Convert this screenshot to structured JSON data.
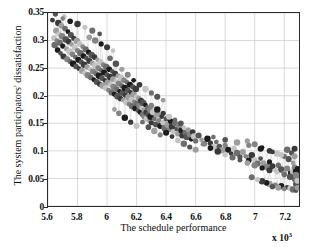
{
  "chart_data": {
    "type": "scatter",
    "title": "",
    "xlabel": "The schedule performance",
    "ylabel": "The system participators' dissatisfaction",
    "x_exponent_label": "x 10",
    "x_exponent_power": "3",
    "xlim": [
      5.6,
      7.3
    ],
    "ylim": [
      0,
      0.35
    ],
    "xticks": [
      "5.6",
      "5.8",
      "6",
      "6.2",
      "6.4",
      "6.6",
      "6.8",
      "7",
      "7.2"
    ],
    "xtick_values": [
      5.6,
      5.8,
      6.0,
      6.2,
      6.4,
      6.6,
      6.8,
      7.0,
      7.2
    ],
    "yticks": [
      "0",
      "0.05",
      "0.1",
      "0.15",
      "0.2",
      "0.25",
      "0.3",
      "0.35"
    ],
    "ytick_values": [
      0,
      0.05,
      0.1,
      0.15,
      0.2,
      0.25,
      0.3,
      0.35
    ],
    "grid": true,
    "grid_color": "#c9c9c9",
    "legend": "none",
    "marker": "circle",
    "marker_colors": [
      "#3a3a3a",
      "#6e6e6e",
      "#9e9e9e",
      "#1c1c1c",
      "#c4c4c4",
      "#545454",
      "#848484"
    ],
    "connector_line_color": "#d8d8d8",
    "series": [
      {
        "name": "pareto-front",
        "points": [
          [
            5.63,
            0.337
          ],
          [
            5.64,
            0.305
          ],
          [
            5.645,
            0.292
          ],
          [
            5.65,
            0.348
          ],
          [
            5.655,
            0.318
          ],
          [
            5.66,
            0.3
          ],
          [
            5.665,
            0.283
          ],
          [
            5.67,
            0.332
          ],
          [
            5.675,
            0.312
          ],
          [
            5.68,
            0.296
          ],
          [
            5.685,
            0.277
          ],
          [
            5.69,
            0.327
          ],
          [
            5.695,
            0.308
          ],
          [
            5.7,
            0.29
          ],
          [
            5.705,
            0.271
          ],
          [
            5.71,
            0.344
          ],
          [
            5.715,
            0.322
          ],
          [
            5.72,
            0.302
          ],
          [
            5.725,
            0.285
          ],
          [
            5.73,
            0.266
          ],
          [
            5.735,
            0.316
          ],
          [
            5.74,
            0.298
          ],
          [
            5.745,
            0.28
          ],
          [
            5.75,
            0.262
          ],
          [
            5.755,
            0.31
          ],
          [
            5.76,
            0.293
          ],
          [
            5.765,
            0.275
          ],
          [
            5.77,
            0.258
          ],
          [
            5.775,
            0.304
          ],
          [
            5.78,
            0.287
          ],
          [
            5.785,
            0.27
          ],
          [
            5.79,
            0.253
          ],
          [
            5.795,
            0.299
          ],
          [
            5.8,
            0.282
          ],
          [
            5.805,
            0.265
          ],
          [
            5.81,
            0.249
          ],
          [
            5.815,
            0.294
          ],
          [
            5.82,
            0.277
          ],
          [
            5.825,
            0.261
          ],
          [
            5.83,
            0.245
          ],
          [
            5.835,
            0.289
          ],
          [
            5.84,
            0.272
          ],
          [
            5.845,
            0.256
          ],
          [
            5.85,
            0.241
          ],
          [
            5.855,
            0.284
          ],
          [
            5.86,
            0.268
          ],
          [
            5.865,
            0.252
          ],
          [
            5.87,
            0.237
          ],
          [
            5.875,
            0.279
          ],
          [
            5.88,
            0.263
          ],
          [
            5.885,
            0.248
          ],
          [
            5.89,
            0.233
          ],
          [
            5.895,
            0.274
          ],
          [
            5.9,
            0.259
          ],
          [
            5.905,
            0.244
          ],
          [
            5.91,
            0.229
          ],
          [
            5.915,
            0.27
          ],
          [
            5.92,
            0.255
          ],
          [
            5.925,
            0.24
          ],
          [
            5.93,
            0.225
          ],
          [
            5.935,
            0.265
          ],
          [
            5.94,
            0.25
          ],
          [
            5.945,
            0.236
          ],
          [
            5.95,
            0.221
          ],
          [
            5.955,
            0.261
          ],
          [
            5.96,
            0.246
          ],
          [
            5.965,
            0.232
          ],
          [
            5.97,
            0.218
          ],
          [
            5.975,
            0.256
          ],
          [
            5.98,
            0.242
          ],
          [
            5.985,
            0.228
          ],
          [
            5.99,
            0.214
          ],
          [
            5.995,
            0.252
          ],
          [
            6.0,
            0.238
          ],
          [
            6.005,
            0.224
          ],
          [
            6.01,
            0.21
          ],
          [
            6.015,
            0.248
          ],
          [
            6.02,
            0.234
          ],
          [
            6.025,
            0.22
          ],
          [
            6.03,
            0.206
          ],
          [
            6.035,
            0.244
          ],
          [
            6.04,
            0.23
          ],
          [
            6.045,
            0.216
          ],
          [
            6.05,
            0.203
          ],
          [
            6.055,
            0.24
          ],
          [
            6.06,
            0.226
          ],
          [
            6.065,
            0.212
          ],
          [
            6.07,
            0.199
          ],
          [
            6.075,
            0.236
          ],
          [
            6.08,
            0.222
          ],
          [
            6.085,
            0.208
          ],
          [
            6.09,
            0.195
          ],
          [
            6.095,
            0.232
          ],
          [
            6.1,
            0.218
          ],
          [
            6.105,
            0.205
          ],
          [
            6.11,
            0.192
          ],
          [
            6.115,
            0.228
          ],
          [
            6.12,
            0.214
          ],
          [
            6.125,
            0.201
          ],
          [
            6.13,
            0.188
          ],
          [
            6.135,
            0.224
          ],
          [
            6.14,
            0.21
          ],
          [
            6.145,
            0.197
          ],
          [
            6.15,
            0.185
          ],
          [
            6.155,
            0.22
          ],
          [
            6.16,
            0.206
          ],
          [
            6.165,
            0.193
          ],
          [
            6.17,
            0.181
          ],
          [
            6.175,
            0.216
          ],
          [
            6.18,
            0.202
          ],
          [
            6.185,
            0.189
          ],
          [
            6.19,
            0.177
          ],
          [
            6.195,
            0.212
          ],
          [
            6.2,
            0.198
          ],
          [
            6.205,
            0.186
          ],
          [
            6.21,
            0.173
          ],
          [
            6.215,
            0.195
          ],
          [
            6.22,
            0.182
          ],
          [
            6.225,
            0.17
          ],
          [
            6.23,
            0.191
          ],
          [
            6.235,
            0.178
          ],
          [
            6.24,
            0.166
          ],
          [
            6.245,
            0.187
          ],
          [
            6.25,
            0.174
          ],
          [
            6.255,
            0.162
          ],
          [
            6.26,
            0.183
          ],
          [
            6.265,
            0.17
          ],
          [
            6.27,
            0.158
          ],
          [
            6.275,
            0.178
          ],
          [
            6.28,
            0.166
          ],
          [
            6.285,
            0.155
          ],
          [
            6.29,
            0.174
          ],
          [
            6.295,
            0.162
          ],
          [
            6.3,
            0.151
          ],
          [
            6.31,
            0.17
          ],
          [
            6.32,
            0.158
          ],
          [
            6.33,
            0.148
          ],
          [
            6.34,
            0.166
          ],
          [
            6.35,
            0.155
          ],
          [
            6.36,
            0.145
          ],
          [
            6.37,
            0.162
          ],
          [
            6.38,
            0.151
          ],
          [
            6.39,
            0.141
          ],
          [
            6.4,
            0.158
          ],
          [
            6.41,
            0.147
          ],
          [
            6.42,
            0.138
          ],
          [
            6.43,
            0.154
          ],
          [
            6.44,
            0.144
          ],
          [
            6.45,
            0.135
          ],
          [
            6.46,
            0.15
          ],
          [
            6.47,
            0.14
          ],
          [
            6.48,
            0.131
          ],
          [
            6.49,
            0.146
          ],
          [
            6.5,
            0.137
          ],
          [
            6.51,
            0.128
          ],
          [
            6.52,
            0.142
          ],
          [
            6.53,
            0.133
          ],
          [
            6.54,
            0.125
          ],
          [
            6.55,
            0.138
          ],
          [
            6.56,
            0.13
          ],
          [
            6.57,
            0.121
          ],
          [
            6.58,
            0.134
          ],
          [
            6.59,
            0.126
          ],
          [
            6.6,
            0.118
          ],
          [
            6.62,
            0.128
          ],
          [
            6.64,
            0.12
          ],
          [
            6.66,
            0.113
          ],
          [
            6.68,
            0.122
          ],
          [
            6.7,
            0.114
          ],
          [
            6.72,
            0.107
          ],
          [
            6.74,
            0.116
          ],
          [
            6.76,
            0.108
          ],
          [
            6.78,
            0.101
          ],
          [
            6.8,
            0.11
          ],
          [
            6.82,
            0.102
          ],
          [
            6.84,
            0.095
          ],
          [
            6.86,
            0.104
          ],
          [
            6.88,
            0.096
          ],
          [
            6.9,
            0.089
          ],
          [
            6.92,
            0.098
          ],
          [
            6.94,
            0.09
          ],
          [
            6.96,
            0.083
          ],
          [
            6.98,
            0.092
          ],
          [
            7.0,
            0.084
          ],
          [
            7.02,
            0.077
          ],
          [
            7.04,
            0.086
          ],
          [
            7.06,
            0.078
          ],
          [
            7.08,
            0.071
          ],
          [
            7.1,
            0.08
          ],
          [
            7.12,
            0.072
          ],
          [
            7.14,
            0.065
          ],
          [
            7.16,
            0.074
          ],
          [
            7.18,
            0.066
          ],
          [
            7.2,
            0.059
          ],
          [
            7.22,
            0.068
          ],
          [
            7.24,
            0.06
          ],
          [
            7.25,
            0.053
          ],
          [
            7.26,
            0.062
          ],
          [
            7.27,
            0.048
          ],
          [
            7.28,
            0.04
          ],
          [
            6.05,
            0.175
          ],
          [
            6.08,
            0.168
          ],
          [
            6.12,
            0.16
          ],
          [
            6.16,
            0.152
          ],
          [
            6.2,
            0.145
          ],
          [
            6.24,
            0.152
          ],
          [
            6.28,
            0.143
          ],
          [
            6.32,
            0.136
          ],
          [
            6.36,
            0.129
          ],
          [
            6.4,
            0.133
          ],
          [
            6.44,
            0.126
          ],
          [
            6.48,
            0.119
          ],
          [
            6.52,
            0.113
          ],
          [
            6.56,
            0.107
          ],
          [
            6.6,
            0.102
          ],
          [
            6.65,
            0.112
          ],
          [
            6.7,
            0.105
          ],
          [
            6.75,
            0.099
          ],
          [
            6.8,
            0.093
          ],
          [
            6.85,
            0.088
          ],
          [
            6.9,
            0.083
          ],
          [
            6.95,
            0.078
          ],
          [
            7.0,
            0.074
          ],
          [
            7.05,
            0.069
          ],
          [
            7.1,
            0.065
          ],
          [
            7.15,
            0.061
          ],
          [
            7.2,
            0.057
          ],
          [
            7.24,
            0.053
          ],
          [
            6.95,
            0.118
          ],
          [
            7.0,
            0.112
          ],
          [
            7.05,
            0.106
          ],
          [
            7.1,
            0.1
          ],
          [
            7.15,
            0.095
          ],
          [
            7.2,
            0.09
          ],
          [
            7.23,
            0.085
          ],
          [
            7.26,
            0.078
          ],
          [
            7.27,
            0.07
          ],
          [
            7.28,
            0.062
          ],
          [
            7.29,
            0.054
          ],
          [
            7.29,
            0.046
          ],
          [
            6.72,
            0.125
          ],
          [
            6.8,
            0.12
          ],
          [
            6.88,
            0.115
          ],
          [
            6.96,
            0.11
          ],
          [
            7.04,
            0.104
          ],
          [
            7.12,
            0.098
          ],
          [
            7.18,
            0.093
          ],
          [
            7.22,
            0.102
          ],
          [
            7.25,
            0.096
          ],
          [
            7.27,
            0.09
          ],
          [
            5.7,
            0.34
          ],
          [
            5.75,
            0.335
          ],
          [
            5.8,
            0.33
          ],
          [
            5.85,
            0.324
          ],
          [
            5.9,
            0.318
          ],
          [
            5.95,
            0.312
          ],
          [
            5.88,
            0.306
          ],
          [
            5.92,
            0.3
          ],
          [
            5.96,
            0.294
          ],
          [
            6.0,
            0.288
          ],
          [
            6.04,
            0.282
          ],
          [
            6.02,
            0.268
          ],
          [
            6.06,
            0.258
          ],
          [
            6.1,
            0.248
          ],
          [
            6.14,
            0.238
          ],
          [
            6.18,
            0.228
          ],
          [
            6.22,
            0.22
          ],
          [
            6.26,
            0.212
          ],
          [
            6.3,
            0.205
          ],
          [
            6.34,
            0.198
          ],
          [
            6.38,
            0.192
          ],
          [
            6.3,
            0.182
          ],
          [
            6.34,
            0.175
          ],
          [
            6.38,
            0.168
          ],
          [
            6.42,
            0.162
          ],
          [
            6.46,
            0.156
          ],
          [
            6.5,
            0.15
          ],
          [
            7.1,
            0.04
          ],
          [
            7.14,
            0.038
          ],
          [
            7.18,
            0.036
          ],
          [
            7.22,
            0.034
          ],
          [
            7.24,
            0.032
          ],
          [
            7.26,
            0.03
          ],
          [
            7.12,
            0.035
          ],
          [
            7.16,
            0.033
          ],
          [
            7.2,
            0.031
          ],
          [
            7.08,
            0.042
          ],
          [
            7.05,
            0.045
          ],
          [
            7.02,
            0.048
          ],
          [
            6.98,
            0.052
          ],
          [
            7.28,
            0.028
          ],
          [
            7.29,
            0.033
          ],
          [
            7.28,
            0.056
          ],
          [
            7.29,
            0.068
          ],
          [
            7.27,
            0.104
          ]
        ]
      }
    ]
  }
}
